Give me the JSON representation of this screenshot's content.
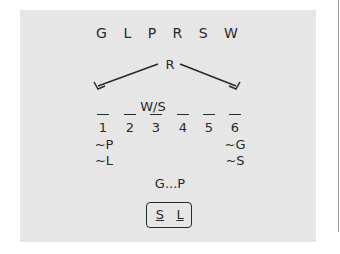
{
  "title_letters": "G L P R S W",
  "root_label": "R",
  "slots_note": "W/S",
  "slot_numbers": [
    "1",
    "2",
    "3",
    "4",
    "5",
    "6"
  ],
  "left_constraints": [
    "~P",
    "~L"
  ],
  "right_constraints": [
    "~G",
    "~S"
  ],
  "sequence_hint": "G...P",
  "answer_box": [
    "S",
    "L"
  ],
  "colors": {
    "panel": "#e6e6e6",
    "ink": "#2a2a2a",
    "background": "#ffffff"
  }
}
